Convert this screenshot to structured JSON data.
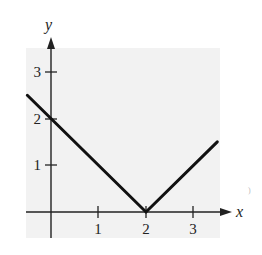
{
  "chart_data": {
    "type": "line",
    "title": "",
    "xlabel": "x",
    "ylabel": "y",
    "xlim": [
      -0.55,
      3.65
    ],
    "ylim": [
      -0.55,
      3.55
    ],
    "x_ticks": [
      1,
      2,
      3
    ],
    "y_ticks": [
      1,
      2,
      3
    ],
    "x_tick_labels": [
      "1",
      "2",
      "3"
    ],
    "y_tick_labels": [
      "1",
      "2",
      "3"
    ],
    "grid": false,
    "background": "#f2f2f2",
    "series": [
      {
        "name": "y = |x - 2|",
        "x": [
          -0.5,
          2,
          3.5
        ],
        "y": [
          2.5,
          0,
          1.5
        ],
        "color": "#111111"
      }
    ]
  }
}
